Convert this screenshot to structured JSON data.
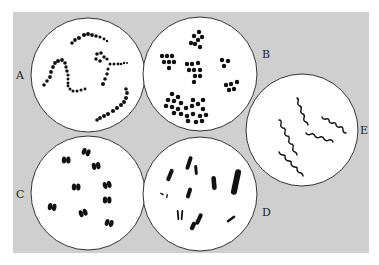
{
  "diagram": {
    "background": {
      "x": 13,
      "y": 12,
      "w": 356,
      "h": 241,
      "color": "#cfcfcf"
    },
    "circle_stroke": "#333333",
    "circle_fill": "#ffffff",
    "ink": "#111111",
    "panels": [
      {
        "id": "A",
        "label": "A",
        "cx": 88,
        "cy": 75,
        "r": 57,
        "label_x": 16,
        "label_y": 69,
        "morphology": "chains of cocci"
      },
      {
        "id": "B",
        "label": "B",
        "cx": 200,
        "cy": 74,
        "r": 57,
        "label_x": 262,
        "label_y": 48,
        "morphology": "clusters of cocci"
      },
      {
        "id": "C",
        "label": "C",
        "cx": 88,
        "cy": 193,
        "r": 57,
        "label_x": 16,
        "label_y": 188,
        "morphology": "paired cocci"
      },
      {
        "id": "D",
        "label": "D",
        "cx": 200,
        "cy": 194,
        "r": 57,
        "label_x": 262,
        "label_y": 206,
        "morphology": "rods"
      },
      {
        "id": "E",
        "label": "E",
        "cx": 302,
        "cy": 130,
        "r": 56,
        "label_x": 360,
        "label_y": 124,
        "morphology": "spirals"
      }
    ]
  }
}
